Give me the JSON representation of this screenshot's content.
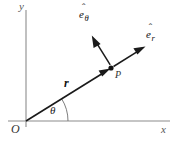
{
  "figure": {
    "background_color": "#ffffff",
    "width": 177,
    "height": 142
  },
  "axes": {
    "x_label": "x",
    "y_label": "y",
    "origin_label": "O",
    "axis_color": "#8c8c8c"
  },
  "labels": {
    "radius": "r",
    "angle": "θ",
    "point": "P",
    "e_r_base": "e",
    "e_r_hat": "ˆ",
    "e_r_sub": "r",
    "e_theta_base": "e",
    "e_theta_hat": "ˆ",
    "e_theta_sub": "θ"
  },
  "geometry": {
    "origin": {
      "x": 26,
      "y": 121
    },
    "point_p": {
      "x": 111,
      "y": 68
    },
    "e_r_tip": {
      "x": 146,
      "y": 46
    },
    "e_theta_tip": {
      "x": 90,
      "y": 33
    },
    "x_axis_end": {
      "x": 170,
      "y": 121
    },
    "y_axis_top": {
      "x": 26,
      "y": 10
    },
    "angle_degrees": 32,
    "arc_radius": 42
  },
  "colors": {
    "vector": "#1a1a1a",
    "axis": "#8c8c8c",
    "arc": "#6e6e6e",
    "point": "#111111"
  }
}
